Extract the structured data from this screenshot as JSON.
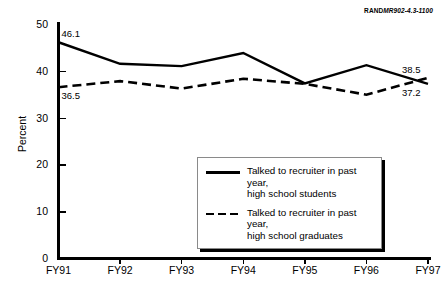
{
  "source_id": {
    "brand": "RAND",
    "number": "MR902-4.3-1100"
  },
  "chart_data": {
    "type": "line",
    "title": "",
    "xlabel": "",
    "ylabel": "Percent",
    "categories": [
      "FY91",
      "FY92",
      "FY93",
      "FY94",
      "FY95",
      "FY96",
      "FY97"
    ],
    "ylim": [
      0,
      50
    ],
    "yticks": [
      0,
      10,
      20,
      30,
      40,
      50
    ],
    "grid": false,
    "legend_position": "center-right-inside",
    "series": [
      {
        "name": "Talked to recruiter in past year, high school students",
        "style": "solid",
        "color": "#000000",
        "values": [
          46.1,
          41.5,
          41.0,
          43.8,
          37.3,
          41.2,
          37.2
        ]
      },
      {
        "name": "Talked to recruiter in past year, high school graduates",
        "style": "dashed",
        "color": "#000000",
        "values": [
          36.5,
          37.8,
          36.2,
          38.3,
          37.2,
          34.9,
          38.5
        ]
      }
    ],
    "annotations": [
      {
        "text": "46.1",
        "series": "students",
        "category": "FY91",
        "value": 46.1,
        "position": "above-right"
      },
      {
        "text": "36.5",
        "series": "graduates",
        "category": "FY91",
        "value": 36.5,
        "position": "below-right"
      },
      {
        "text": "38.5",
        "series": "graduates",
        "category": "FY97",
        "value": 38.5,
        "position": "above-left"
      },
      {
        "text": "37.2",
        "series": "students",
        "category": "FY97",
        "value": 37.2,
        "position": "below-left"
      }
    ]
  },
  "legend": {
    "entries": [
      {
        "line1": "Talked to recruiter in past year,",
        "line2": "high school students"
      },
      {
        "line1": "Talked to recruiter in past year,",
        "line2": "high school graduates"
      }
    ]
  }
}
